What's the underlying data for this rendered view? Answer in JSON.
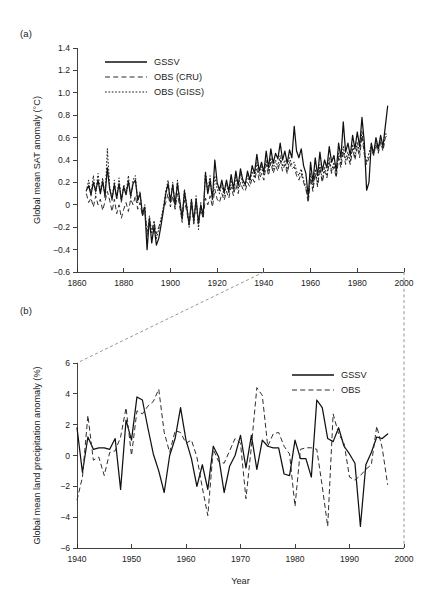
{
  "figure": {
    "panel_a_label": "(a)",
    "panel_b_label": "(b)"
  },
  "chart_data": [
    {
      "id": "panel_a",
      "type": "line",
      "title": "",
      "xlabel": "",
      "ylabel": "Global mean SAT anomaly (°C)",
      "xlim": [
        1860,
        2000
      ],
      "ylim": [
        -0.6,
        1.4
      ],
      "xticks": [
        1860,
        1880,
        1900,
        1920,
        1940,
        1960,
        1980,
        2000
      ],
      "xtick_labels": [
        "1860",
        "1880",
        "1900",
        "1920",
        "1940",
        "1960",
        "1980",
        "2000"
      ],
      "yticks": [
        -0.6,
        -0.4,
        -0.2,
        0,
        0.2,
        0.4,
        0.6,
        0.8,
        1.0,
        1.2,
        1.4
      ],
      "ytick_labels": [
        "−0.6",
        "−0.4",
        "−0.2",
        "0",
        "0.2",
        "0.4",
        "0.6",
        "0.8",
        "1.0",
        "1.2",
        "1.4"
      ],
      "grid": false,
      "legend_position": "upper-left",
      "legend": [
        "GSSV",
        "OBS (CRU)",
        "OBS (GISS)"
      ],
      "x_start": 1864,
      "series": [
        {
          "name": "GSSV",
          "style": "solid",
          "values": [
            0.13,
            0.17,
            0.09,
            0.2,
            0.12,
            0.22,
            0.1,
            0.21,
            0.08,
            0.33,
            0.14,
            0.05,
            0.18,
            0.06,
            0.19,
            0.04,
            0.16,
            0.09,
            0.21,
            0.08,
            0.19,
            0.22,
            0.04,
            0.1,
            -0.08,
            -0.02,
            -0.4,
            -0.12,
            -0.34,
            -0.19,
            -0.36,
            -0.3,
            -0.18,
            -0.05,
            0.1,
            0.19,
            0.03,
            0.18,
            0.0,
            0.19,
            0.04,
            -0.12,
            0.12,
            -0.02,
            -0.18,
            0.04,
            -0.14,
            0.05,
            -0.16,
            0.0,
            -0.1,
            0.28,
            0.1,
            0.22,
            0.05,
            0.4,
            0.2,
            0.13,
            0.22,
            0.11,
            0.22,
            0.12,
            0.27,
            0.14,
            0.3,
            0.17,
            0.32,
            0.22,
            0.18,
            0.3,
            0.22,
            0.35,
            0.28,
            0.45,
            0.3,
            0.38,
            0.29,
            0.48,
            0.33,
            0.5,
            0.37,
            0.46,
            0.41,
            0.55,
            0.4,
            0.48,
            0.37,
            0.49,
            0.42,
            0.7,
            0.48,
            0.42,
            0.5,
            0.35,
            0.28,
            0.07,
            0.38,
            0.2,
            0.42,
            0.26,
            0.47,
            0.3,
            0.4,
            0.33,
            0.52,
            0.38,
            0.44,
            0.3,
            0.55,
            0.42,
            0.74,
            0.47,
            0.55,
            0.44,
            0.62,
            0.5,
            0.65,
            0.52,
            0.78,
            0.56,
            0.13,
            0.2,
            0.55,
            0.45,
            0.6,
            0.5,
            0.62,
            0.52,
            0.7,
            0.88
          ]
        },
        {
          "name": "OBS (CRU)",
          "style": "dashed",
          "values": [
            0.1,
            0.02,
            0.06,
            -0.02,
            0.08,
            0.0,
            0.05,
            -0.05,
            0.03,
            0.12,
            0.04,
            -0.06,
            0.05,
            -0.08,
            0.0,
            -0.12,
            -0.04,
            0.02,
            -0.06,
            0.05,
            0.0,
            0.08,
            -0.04,
            0.02,
            -0.1,
            -0.05,
            -0.24,
            -0.14,
            -0.22,
            -0.16,
            -0.26,
            -0.2,
            -0.14,
            -0.04,
            0.02,
            0.1,
            -0.02,
            0.08,
            -0.04,
            0.1,
            -0.02,
            -0.14,
            0.04,
            -0.06,
            -0.18,
            0.0,
            -0.16,
            0.02,
            -0.18,
            -0.04,
            -0.12,
            0.06,
            0.0,
            0.08,
            -0.02,
            0.14,
            0.05,
            0.02,
            0.1,
            0.04,
            0.12,
            0.06,
            0.16,
            0.08,
            0.18,
            0.1,
            0.2,
            0.14,
            0.12,
            0.2,
            0.16,
            0.24,
            0.2,
            0.32,
            0.22,
            0.28,
            0.22,
            0.36,
            0.26,
            0.38,
            0.28,
            0.35,
            0.3,
            0.4,
            0.3,
            0.36,
            0.28,
            0.38,
            0.32,
            0.34,
            0.26,
            0.22,
            0.28,
            0.2,
            0.14,
            0.02,
            0.24,
            0.12,
            0.28,
            0.16,
            0.33,
            0.2,
            0.3,
            0.24,
            0.38,
            0.28,
            0.34,
            0.24,
            0.42,
            0.33,
            0.48,
            0.36,
            0.43,
            0.36,
            0.5,
            0.4,
            0.52,
            0.42,
            0.62,
            0.45,
            0.36,
            0.42,
            0.5,
            0.44,
            0.54,
            0.46,
            0.56,
            0.48,
            0.6,
            0.62
          ]
        },
        {
          "name": "OBS (GISS)",
          "style": "dotted",
          "values": [
            0.12,
            0.22,
            0.08,
            0.26,
            0.1,
            0.28,
            0.12,
            0.24,
            0.06,
            0.5,
            0.16,
            0.04,
            0.22,
            0.05,
            0.24,
            0.02,
            0.18,
            0.1,
            0.26,
            0.06,
            0.22,
            0.26,
            0.02,
            0.12,
            -0.1,
            0.0,
            -0.28,
            -0.1,
            -0.26,
            -0.14,
            -0.3,
            -0.22,
            -0.12,
            -0.02,
            0.12,
            0.22,
            0.02,
            0.2,
            -0.02,
            0.22,
            0.02,
            -0.16,
            0.14,
            0.0,
            -0.2,
            0.06,
            -0.18,
            0.08,
            -0.22,
            0.02,
            -0.12,
            0.3,
            0.12,
            0.26,
            0.04,
            0.26,
            0.14,
            0.1,
            0.18,
            0.08,
            0.2,
            0.1,
            0.22,
            0.12,
            0.26,
            0.14,
            0.28,
            0.18,
            0.16,
            0.26,
            0.2,
            0.3,
            0.24,
            0.38,
            0.26,
            0.34,
            0.26,
            0.4,
            0.3,
            0.42,
            0.32,
            0.4,
            0.34,
            0.44,
            0.34,
            0.4,
            0.3,
            0.42,
            0.36,
            0.38,
            0.3,
            0.26,
            0.32,
            0.22,
            0.16,
            0.04,
            0.28,
            0.14,
            0.32,
            0.18,
            0.36,
            0.22,
            0.34,
            0.26,
            0.42,
            0.3,
            0.38,
            0.26,
            0.46,
            0.36,
            0.52,
            0.4,
            0.47,
            0.38,
            0.54,
            0.42,
            0.56,
            0.46,
            0.66,
            0.48,
            0.38,
            0.46,
            0.54,
            0.46,
            0.58,
            0.48,
            0.6,
            0.5,
            0.63,
            0.64
          ]
        }
      ]
    },
    {
      "id": "panel_b",
      "type": "line",
      "title": "",
      "xlabel": "Year",
      "ylabel": "Global mean land precipitation anomaly (%)",
      "xlim": [
        1940,
        2000
      ],
      "ylim": [
        -6,
        6
      ],
      "xticks": [
        1940,
        1950,
        1960,
        1970,
        1980,
        1990,
        2000
      ],
      "xtick_labels": [
        "1940",
        "1950",
        "1960",
        "1970",
        "1980",
        "1990",
        "2000"
      ],
      "yticks": [
        -6,
        -4,
        -2,
        0,
        2,
        4,
        6
      ],
      "ytick_labels": [
        "−6",
        "−4",
        "−2",
        "0",
        "2",
        "4",
        "6"
      ],
      "grid": false,
      "legend_position": "upper-right",
      "legend": [
        "GSSV",
        "OBS"
      ],
      "x_start": 1940,
      "series": [
        {
          "name": "GSSV",
          "style": "solid",
          "values": [
            1.8,
            -1.1,
            1.2,
            0.4,
            0.5,
            0.5,
            0.4,
            1.1,
            -2.2,
            2.3,
            1.0,
            3.8,
            3.6,
            1.8,
            0.1,
            -1.0,
            -2.4,
            0.0,
            1.1,
            3.1,
            1.0,
            -0.2,
            -2.0,
            -0.6,
            -2.2,
            0.6,
            -0.1,
            -2.4,
            -0.7,
            0.0,
            1.3,
            -0.8,
            1.3,
            -0.9,
            1.0,
            0.6,
            0.5,
            0.5,
            -1.2,
            -1.3,
            1.0,
            -0.2,
            -0.2,
            -1.4,
            3.6,
            3.1,
            1.1,
            0.9,
            1.8,
            0.6,
            0.1,
            -0.5,
            -4.6,
            -0.6,
            0.2,
            1.2,
            1.1,
            1.4
          ]
        },
        {
          "name": "OBS",
          "style": "dashed",
          "values": [
            -2.9,
            -1.4,
            2.6,
            -0.3,
            -0.1,
            -1.3,
            0.2,
            0.3,
            1.2,
            3.1,
            0.0,
            2.9,
            2.7,
            3.2,
            3.5,
            4.3,
            1.5,
            0.2,
            1.6,
            1.5,
            0.8,
            1.0,
            -0.1,
            -2.1,
            -3.9,
            0.4,
            -0.4,
            -0.5,
            0.3,
            1.1,
            0.8,
            -2.8,
            0.6,
            4.4,
            3.9,
            0.6,
            1.4,
            1.5,
            0.6,
            0.1,
            -3.3,
            0.4,
            0.5,
            0.5,
            0.4,
            -2.0,
            -4.6,
            2.7,
            1.4,
            0.8,
            -1.4,
            -1.6,
            -1.3,
            -0.9,
            -0.6,
            1.9,
            0.5,
            -1.9
          ]
        }
      ]
    }
  ]
}
